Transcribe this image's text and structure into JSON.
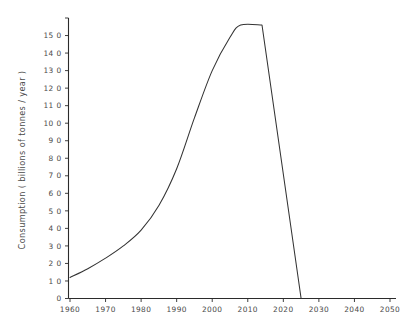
{
  "chart_data": {
    "type": "line",
    "title": "",
    "xlabel": "",
    "ylabel": "Consumption ( billions of tonnes / year )",
    "xlim": [
      1957,
      2052
    ],
    "ylim": [
      0,
      16
    ],
    "grid": false,
    "legend": null,
    "x_ticks": [
      1960,
      1970,
      1980,
      1990,
      2000,
      2010,
      2020,
      2030,
      2040,
      2050
    ],
    "x_tick_labels": [
      "1960",
      "1970",
      "1980",
      "1990",
      "2000",
      "2010",
      "2020",
      "2030",
      "2040",
      "2050"
    ],
    "y_ticks": [
      0,
      1,
      2,
      3,
      4,
      5,
      6,
      7,
      8,
      9,
      10,
      11,
      12,
      13,
      14,
      15,
      16
    ],
    "y_tick_labels": [
      "0",
      "1 0",
      "2 0",
      "3 0",
      "4 0",
      "5 0",
      "6 0",
      "7 0",
      "8 0",
      "9 0",
      "10 0",
      "11 0",
      "12 0",
      "13 0",
      "14 0",
      "15 0",
      ""
    ],
    "series": [
      {
        "name": "Consumption",
        "color": "#333333",
        "x": [
          1960,
          1965,
          1970,
          1975,
          1980,
          1985,
          1990,
          1995,
          2000,
          2005,
          2008,
          2014,
          2025
        ],
        "values": [
          1.2,
          1.7,
          2.3,
          3.0,
          3.9,
          5.3,
          7.4,
          10.3,
          13.0,
          14.9,
          15.6,
          15.6,
          0.0
        ]
      }
    ],
    "annotations": []
  }
}
